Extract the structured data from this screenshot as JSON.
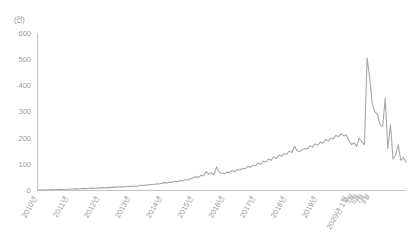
{
  "chart_data": {
    "type": "line",
    "title": "",
    "subtitle": "",
    "unit_label": "(건)",
    "xlabel": "",
    "ylabel": "",
    "ylim": [
      0,
      600
    ],
    "yticks": [
      0,
      100,
      200,
      300,
      400,
      500,
      600
    ],
    "ytick_labels": [
      "0",
      "100",
      "200",
      "300",
      "400",
      "500",
      "600"
    ],
    "grid": false,
    "legend": "none",
    "line_color": "#a8a8a8",
    "axis_color": "#bdbdbd",
    "xtick_labels": [
      "2010년",
      "2011년",
      "2012년",
      "2013년",
      "2014년",
      "2015년",
      "2016년",
      "2017년",
      "2018년",
      "2019년",
      "2020년 1월",
      "3월",
      "5월",
      "7월",
      "9월"
    ],
    "x_major_ticks": [
      "2010년",
      "2011년",
      "2012년",
      "2013년",
      "2014년",
      "2015년",
      "2016년",
      "2017년",
      "2018년",
      "2019년",
      "2020년 1월"
    ],
    "x_minor_ticks": [
      "3월",
      "5월",
      "7월",
      "9월"
    ],
    "series": [
      {
        "name": "건수",
        "color": "#a8a8a8",
        "values": [
          2,
          2,
          3,
          2,
          3,
          3,
          4,
          3,
          4,
          5,
          4,
          5,
          5,
          6,
          6,
          7,
          6,
          7,
          8,
          7,
          8,
          9,
          8,
          9,
          10,
          11,
          10,
          12,
          11,
          13,
          12,
          14,
          13,
          15,
          14,
          16,
          15,
          17,
          16,
          18,
          20,
          19,
          22,
          21,
          24,
          23,
          26,
          25,
          28,
          30,
          29,
          32,
          31,
          35,
          33,
          38,
          36,
          42,
          40,
          45,
          48,
          52,
          50,
          58,
          55,
          72,
          62,
          68,
          60,
          90,
          70,
          66,
          64,
          70,
          68,
          75,
          72,
          80,
          78,
          85,
          82,
          92,
          88,
          96,
          94,
          105,
          100,
          112,
          108,
          120,
          115,
          128,
          122,
          135,
          130,
          140,
          138,
          150,
          145,
          168,
          152,
          148,
          155,
          160,
          158,
          170,
          165,
          178,
          172,
          185,
          180,
          195,
          188,
          200,
          196,
          210,
          205,
          215,
          208,
          212,
          190,
          175,
          182,
          168,
          200,
          185,
          175,
          505,
          430,
          330,
          300,
          290,
          250,
          245,
          350,
          160,
          250,
          120,
          135,
          175,
          115,
          125,
          108
        ],
        "notable_points": {
          "peak_value": 505,
          "peak_label": "2020년 3월",
          "secondary_peak_value": 350,
          "secondary_peak_label": "2020년 6월",
          "final_value": 108
        }
      }
    ]
  }
}
